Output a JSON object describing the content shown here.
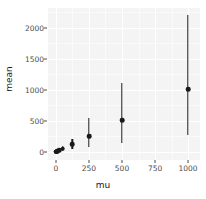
{
  "chart_data": {
    "type": "scatter",
    "title": "",
    "xlabel": "mu",
    "ylabel": "mean",
    "xlim": [
      -60,
      1090
    ],
    "ylim": [
      -130,
      2320
    ],
    "x_ticks": [
      "0",
      "250",
      "500",
      "750",
      "1000"
    ],
    "x_tick_values": [
      0,
      250,
      500,
      750,
      1000
    ],
    "y_ticks": [
      "0",
      "500",
      "1000",
      "1500",
      "2000"
    ],
    "y_tick_values": [
      0,
      500,
      1000,
      1500,
      2000
    ],
    "grid": true,
    "legend": "none",
    "panel_background": "#f4f4f4",
    "gridline_color": "#ffffff",
    "point_color": "#1a1a1a",
    "series": [
      {
        "name": "mean",
        "marker": "point-range",
        "x": [
          1,
          2,
          5,
          10,
          25,
          50,
          125,
          250,
          500,
          1000
        ],
        "values": [
          1,
          2,
          5,
          10,
          26,
          52,
          128,
          252,
          508,
          1010
        ],
        "ymin": [
          0,
          0,
          1,
          3,
          9,
          18,
          55,
          82,
          140,
          268
        ],
        "ymax": [
          3,
          5,
          10,
          19,
          45,
          92,
          212,
          540,
          1105,
          2205
        ]
      }
    ]
  },
  "axes": {
    "y_title": "mean",
    "x_title": "mu"
  }
}
